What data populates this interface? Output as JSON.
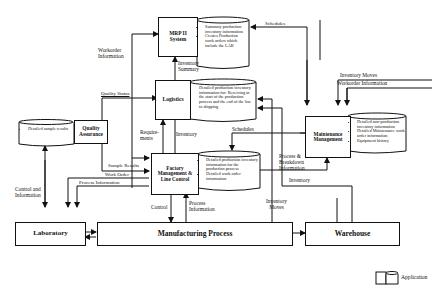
{
  "diagram": {
    "nodes": {
      "mrp": {
        "label_line1": "MRP II",
        "label_line2": "System",
        "data_items": [
          "Summary production inventory information",
          "Creates Production work orders which include the LAB"
        ]
      },
      "logistics": {
        "label": "Logistics",
        "data_items": [
          "Detailed production inventory information for: Receiving to the start of the production process and the end of the line to shipping"
        ]
      },
      "quality": {
        "label_line1": "Quality",
        "label_line2": "Assurance",
        "data_items": [
          "Detailed sample results"
        ]
      },
      "factory": {
        "label_line1": "Factory",
        "label_line2": "Management &",
        "label_line3": "Line Control",
        "data_items": [
          "Detailed production inventory information for the production process",
          "Detailed work order information"
        ]
      },
      "maintenance": {
        "label_line1": "Maintenance",
        "label_line2": "Management",
        "data_items": [
          "Detailed non-production inventory information",
          "Detailed Maintenance work order information",
          "Equipment history"
        ]
      },
      "laboratory": {
        "label": "Laboratory"
      },
      "manufacturing": {
        "label": "Manufacturing Process"
      },
      "warehouse": {
        "label": "Warehouse"
      }
    },
    "edge_labels": {
      "workorder_info": [
        "Workorder",
        "Information"
      ],
      "inventory_summary": [
        "Inventory",
        "Summary"
      ],
      "schedules_top": "Schedules",
      "quality_status": "Quality Status",
      "requirements": [
        "Require-",
        "ments"
      ],
      "inventory_mid": "Inventory",
      "schedules_mid": "Schedules",
      "inventory_moves_right": "Inventory Moves",
      "workorder_info_right": "Workorder Information",
      "process_breakdown": [
        "Process &",
        "Breakdown",
        "Information"
      ],
      "inventory_low": "Inventory",
      "sample_results": "Sample Results",
      "work_order": "Work Order",
      "process_information": "Process Information",
      "control_and_info": [
        "Control and",
        "Information"
      ],
      "control": "Control",
      "process_info_up": [
        "Process",
        "Information"
      ],
      "inventory_moves_low": [
        "Inventory",
        "Moves"
      ]
    },
    "legend": {
      "label": "Application"
    }
  }
}
